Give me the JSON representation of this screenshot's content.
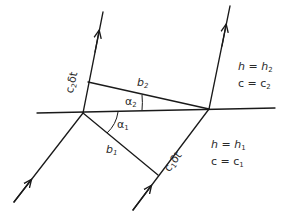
{
  "diagram": {
    "colors": {
      "line": "#1a1a1a",
      "text": "#2a2a2a",
      "background": "#ffffff"
    },
    "labels": {
      "b1": {
        "base": "b",
        "sub": "1"
      },
      "b2": {
        "base": "b",
        "sub": "2"
      },
      "alpha1": {
        "base": "α",
        "sub": "1"
      },
      "alpha2": {
        "base": "α",
        "sub": "2"
      },
      "c1dt": {
        "c": "c",
        "c_sub": "1",
        "delta": "δ",
        "t": "t"
      },
      "c2dt": {
        "c": "c",
        "c_sub": "2",
        "delta": "δ",
        "t": "t"
      }
    },
    "media": {
      "upper": {
        "h_lhs": "h",
        "eq": " = ",
        "h_rhs": "h",
        "h_sub": "2",
        "c_lhs": "c",
        "c_rhs": "c",
        "c_sub": "2"
      },
      "lower": {
        "h_lhs": "h",
        "eq": " = ",
        "h_rhs": "h",
        "h_sub": "1",
        "c_lhs": "c",
        "c_rhs": "c",
        "c_sub": "1"
      }
    },
    "geometry": {
      "interface": {
        "x1": 37,
        "y1": 113,
        "x2": 275,
        "y2": 108
      },
      "left_ray_lower": {
        "x1": 14,
        "y1": 202,
        "x2": 83,
        "y2": 113
      },
      "left_ray_upper": {
        "x1": 83,
        "y1": 113,
        "x2": 103,
        "y2": 12
      },
      "right_ray_lower": {
        "x1": 133,
        "y1": 210,
        "x2": 209,
        "y2": 109
      },
      "right_ray_upper": {
        "x1": 209,
        "y1": 109,
        "x2": 230,
        "y2": 6
      },
      "wavefront_b1": {
        "x1": 83,
        "y1": 113,
        "x2": 158,
        "y2": 175
      },
      "wavefront_b2": {
        "x1": 88,
        "y1": 82,
        "x2": 209,
        "y2": 109
      }
    }
  }
}
